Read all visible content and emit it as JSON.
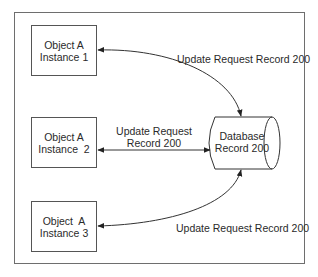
{
  "diagram": {
    "objects": [
      {
        "line1": "Object A",
        "line2": "Instance 1"
      },
      {
        "line1": "Object A",
        "line2": "Instance  2"
      },
      {
        "line1": "Object  A",
        "line2": "Instance 3"
      }
    ],
    "database": {
      "line1": "Database",
      "line2": "Record 200"
    },
    "edges": [
      {
        "from": "Object A Instance 1",
        "to": "Database Record 200",
        "label": "Update Request Record 200",
        "bidirectional": true
      },
      {
        "from": "Object A Instance 2",
        "to": "Database Record 200",
        "label_line1": "Update Request",
        "label_line2": "Record 200",
        "bidirectional": true
      },
      {
        "from": "Object A Instance 3",
        "to": "Database Record 200",
        "label": "Update Request Record 200",
        "bidirectional": true
      }
    ],
    "colors": {
      "line": "#333333",
      "frame": "#6e6e6e",
      "background": "#ffffff"
    }
  }
}
